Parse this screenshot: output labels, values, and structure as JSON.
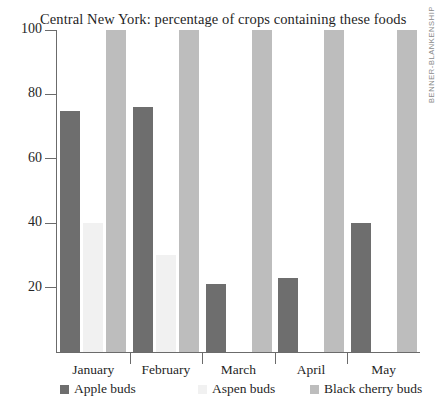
{
  "chart_data": {
    "type": "bar",
    "title": "Central New York: percentage of crops containing these foods",
    "xlabel": "",
    "ylabel": "",
    "ylim": [
      0,
      100
    ],
    "yticks": [
      20,
      40,
      60,
      80,
      100
    ],
    "ytick_labels": [
      "20",
      "40",
      "60",
      "80",
      "100"
    ],
    "grid": false,
    "legend_position": "bottom",
    "categories": [
      "January",
      "February",
      "March",
      "April",
      "May"
    ],
    "series": [
      {
        "name": "Apple buds",
        "color": "#6e6e6e",
        "values": [
          75,
          76,
          21,
          23,
          40
        ]
      },
      {
        "name": "Aspen buds",
        "color": "#f1f1f1",
        "values": [
          40,
          30,
          0,
          0,
          0
        ]
      },
      {
        "name": "Black cherry buds",
        "color": "#bdbdbd",
        "values": [
          100,
          100,
          100,
          100,
          100
        ]
      }
    ]
  },
  "credit": {
    "text": "BENNER-BLANKENSHIP"
  },
  "axis": {
    "tick_0": "20",
    "tick_1": "40",
    "tick_2": "60",
    "tick_3": "80",
    "tick_4": "100"
  },
  "xaxis": {
    "label_0": "January",
    "label_1": "February",
    "label_2": "March",
    "label_3": "April",
    "label_4": "May"
  },
  "legend": {
    "item_0": "Apple buds",
    "item_1": "Aspen buds",
    "item_2": "Black cherry buds"
  }
}
